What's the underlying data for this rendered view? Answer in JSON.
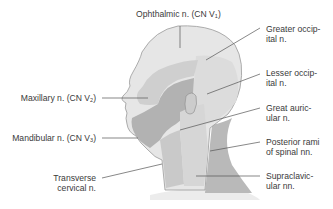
{
  "figure": {
    "type": "anatomical-diagram",
    "colors": {
      "ophthalmic": "#e6e6e6",
      "maxillary": "#cfcfcf",
      "mandibular": "#b2b2b2",
      "occipital_band": "#dcdcdc",
      "great_auricular": "#d2d2d2",
      "posterior_rami": "#b9b9b9",
      "supraclavicular": "#ececec",
      "transverse_cervical": "#c9c9c9",
      "outline": "#9a9a9a",
      "leader_line": "#555555",
      "text": "#3a3a3a"
    },
    "labels": {
      "ophthalmic": {
        "text": "Ophthalmic n. (CN V",
        "sub": "1",
        "close": ")"
      },
      "maxillary": {
        "text": "Maxillary n. (CN V",
        "sub": "2",
        "close": ")"
      },
      "mandibular": {
        "text": "Mandibular n. (CN V",
        "sub": "3",
        "close": ")"
      },
      "transverse_cervical": {
        "line1": "Transverse",
        "line2": "cervical n."
      },
      "greater_occipital": {
        "line1": "Greater occip-",
        "line2": "ital n."
      },
      "lesser_occipital": {
        "line1": "Lesser occip-",
        "line2": "ital n."
      },
      "great_auricular": {
        "line1": "Great auric-",
        "line2": "ular n."
      },
      "posterior_rami": {
        "line1": "Posterior rami",
        "line2": "of spinal nn."
      },
      "supraclavicular": {
        "line1": "Supraclavic-",
        "line2": "ular nn."
      }
    }
  }
}
